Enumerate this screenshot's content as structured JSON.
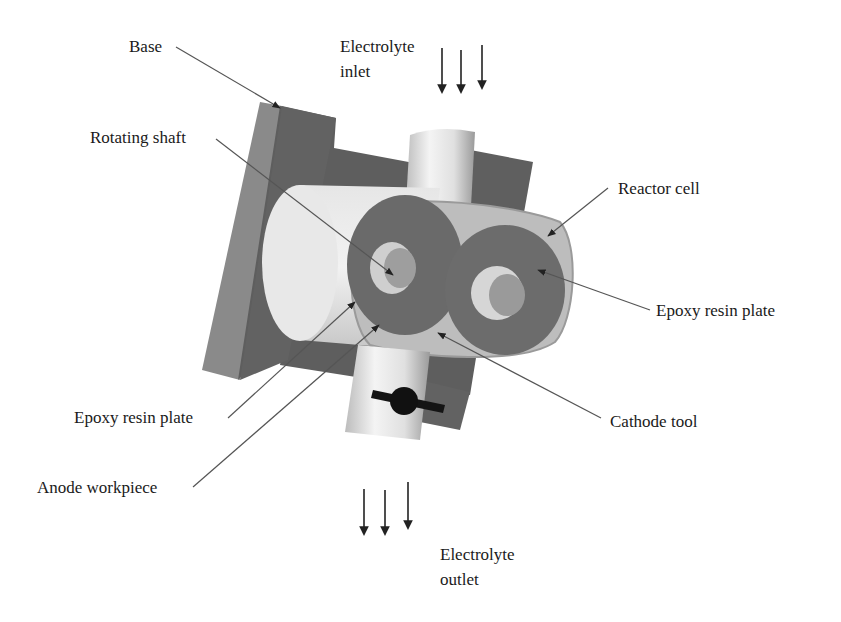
{
  "figure": {
    "background": "#ffffff"
  },
  "labels": {
    "base": "Base",
    "electrolyte_inlet_line1": "Electrolyte",
    "electrolyte_inlet_line2": "inlet",
    "rotating_shaft": "Rotating shaft",
    "reactor_cell": "Reactor cell",
    "epoxy_resin_plate_right": "Epoxy resin plate",
    "epoxy_resin_plate_left": "Epoxy resin plate",
    "cathode_tool": "Cathode tool",
    "anode_workpiece": "Anode workpiece",
    "electrolyte_outlet_line1": "Electrolyte",
    "electrolyte_outlet_line2": "outlet"
  },
  "colors": {
    "base_front": "#6e6e6e",
    "base_side": "#8a8a8a",
    "dark_plate": "#5c5c5c",
    "cylinder_light": "#e6e6e6",
    "cylinder_mid": "#bdbdbd",
    "disc_dark": "#6a6a6a",
    "shaft_light": "#d0d0d0",
    "housing": "#b8b8b8",
    "valve": "#111111",
    "leader": "#555555",
    "arrow": "#222222"
  }
}
